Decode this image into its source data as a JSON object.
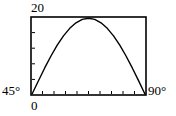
{
  "figure": {
    "name": "projectile-range-vs-angle-plot",
    "background_color": "#ffffff",
    "line_color": "#000000",
    "frame": {
      "left": 31,
      "top": 17,
      "right": 146,
      "bottom": 95,
      "stroke_width": 1.6
    },
    "labels": {
      "y_max": "20",
      "x_min_angle": "45°",
      "x_min_origin": "0",
      "x_max_angle": "90°"
    }
  },
  "chart_data": {
    "type": "line",
    "title": "",
    "xlabel": "",
    "ylabel": "",
    "xlim": [
      0,
      90
    ],
    "ylim": [
      0,
      20
    ],
    "grid": false,
    "legend": null,
    "axis_corner_labels": {
      "top_left_y": "20",
      "bottom_left_y": "45°",
      "bottom_left_x": "0",
      "bottom_right_x": "90°"
    },
    "x_tick_count": 9,
    "y_tick_count": 4,
    "ticks_direction": "inward",
    "x": [
      0,
      5,
      10,
      15,
      20,
      25,
      30,
      35,
      40,
      45,
      50,
      55,
      60,
      65,
      70,
      75,
      80,
      85,
      90
    ],
    "y": [
      0,
      3.47,
      6.84,
      10.0,
      12.86,
      15.32,
      17.32,
      18.79,
      19.7,
      20.0,
      19.7,
      18.79,
      17.32,
      15.32,
      12.86,
      10.0,
      6.84,
      3.47,
      0
    ],
    "series": [
      {
        "name": "range",
        "values": [
          0,
          3.47,
          6.84,
          10.0,
          12.86,
          15.32,
          17.32,
          18.79,
          19.7,
          20.0,
          19.7,
          18.79,
          17.32,
          15.32,
          12.86,
          10.0,
          6.84,
          3.47,
          0
        ]
      }
    ]
  }
}
